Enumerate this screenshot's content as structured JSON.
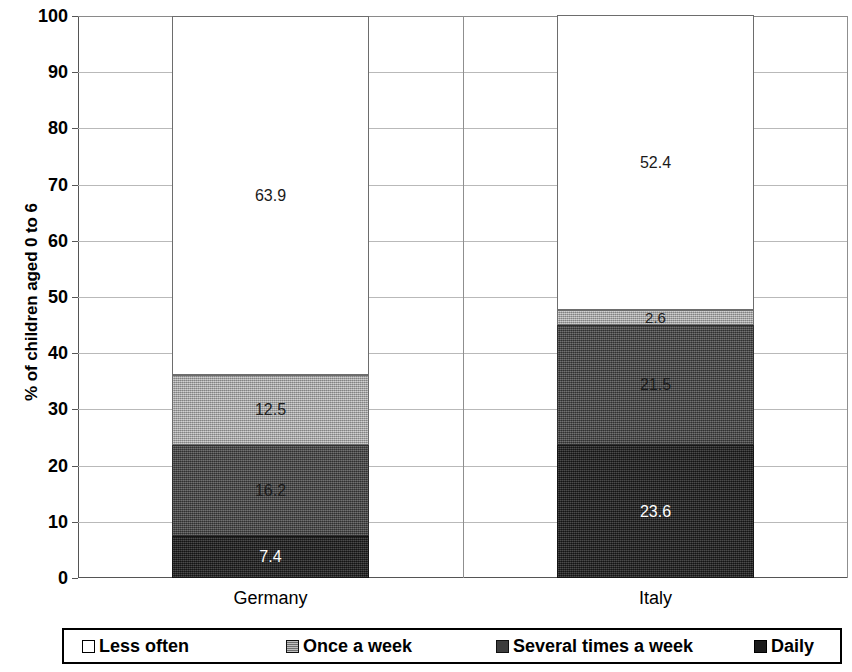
{
  "chart_data": {
    "type": "bar",
    "subtype": "stacked-bar-100",
    "title": "",
    "xlabel": "",
    "ylabel": "% of children aged 0 to 6",
    "ylim": [
      0,
      100
    ],
    "yticks": [
      0,
      10,
      20,
      30,
      40,
      50,
      60,
      70,
      80,
      90,
      100
    ],
    "ytick_labels": [
      "0",
      "10",
      "20",
      "30",
      "40",
      "50",
      "60",
      "70",
      "80",
      "90",
      "100"
    ],
    "grid": true,
    "legend_position": "bottom",
    "categories": [
      "Germany",
      "Italy"
    ],
    "series": [
      {
        "name": "Daily",
        "values": [
          7.4,
          23.6
        ],
        "color": "#262626"
      },
      {
        "name": "Several times a week",
        "values": [
          16.2,
          21.5
        ],
        "color": "#4a4a4a"
      },
      {
        "name": "Once a week",
        "values": [
          12.5,
          2.6
        ],
        "color": "#a8a8a8"
      },
      {
        "name": "Less often",
        "values": [
          63.9,
          52.4
        ],
        "color": "#ffffff"
      }
    ],
    "data_labels": {
      "Germany": [
        "7.4",
        "16.2",
        "12.5",
        "63.9"
      ],
      "Italy": [
        "23.6",
        "21.5",
        "2.6",
        "52.4"
      ]
    }
  },
  "axis": {
    "y_title": "% of children aged 0 to 6"
  },
  "legend": {
    "items": [
      {
        "label": "Less often",
        "swatch": "legend-swatch-less-often"
      },
      {
        "label": "Once a week",
        "swatch": "legend-swatch-once-a-week"
      },
      {
        "label": "Several times a week",
        "swatch": "legend-swatch-several-times-a-week"
      },
      {
        "label": "Daily",
        "swatch": "legend-swatch-daily"
      }
    ]
  }
}
